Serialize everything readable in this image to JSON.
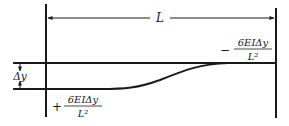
{
  "diagram": {
    "span_label": "L",
    "displacement_label": "Δy",
    "moment_left": {
      "sign": "+",
      "numerator": "6EIΔy",
      "denominator": "L²"
    },
    "moment_right": {
      "sign": "−",
      "numerator": "6EIΔy",
      "denominator": "L²"
    },
    "colors": {
      "line": "#1a1a1a",
      "background": "#ffffff"
    }
  }
}
